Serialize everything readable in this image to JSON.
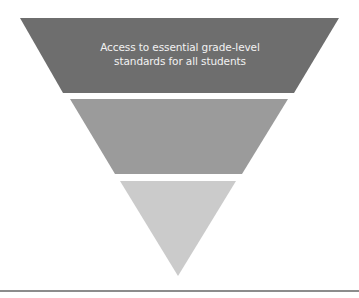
{
  "diagram": {
    "type": "inverted-pyramid",
    "tiers": [
      {
        "level": 1,
        "label_lines": [
          "Access to essential grade-level",
          "standards for all students"
        ],
        "color": "#6e6e6e"
      },
      {
        "level": 2,
        "label_lines": [],
        "color": "#9b9b9b"
      },
      {
        "level": 3,
        "label_lines": [],
        "color": "#cbcbcb"
      }
    ],
    "baseline_color": "#8c8c8c"
  }
}
